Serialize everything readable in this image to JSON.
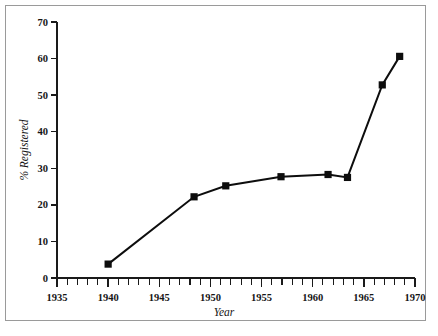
{
  "chart_data": {
    "type": "line",
    "title": "",
    "subtitle": "",
    "xlabel": "Year",
    "ylabel": "% Registered",
    "xlim": [
      1935,
      1970
    ],
    "ylim": [
      0,
      70
    ],
    "grid": false,
    "legend": false,
    "x_tick_labels": [
      "1935",
      "1940",
      "1945",
      "1950",
      "1955",
      "1960",
      "1965",
      "1970"
    ],
    "x_tick_values": [
      1935,
      1940,
      1945,
      1950,
      1955,
      1960,
      1965,
      1970
    ],
    "x_minor_tick_step": 1,
    "y_tick_labels": [
      "0",
      "10",
      "20",
      "30",
      "40",
      "50",
      "60",
      "70"
    ],
    "y_tick_values": [
      0,
      10,
      20,
      30,
      40,
      50,
      60,
      70
    ],
    "series": [
      {
        "name": "% Registered",
        "marker": "square",
        "color": "#0d0d0d",
        "x": [
          1940.0,
          1948.4,
          1951.5,
          1956.9,
          1961.5,
          1963.4,
          1966.8,
          1968.5
        ],
        "y": [
          3.8,
          22.2,
          25.2,
          27.7,
          28.3,
          27.5,
          52.8,
          60.6
        ]
      }
    ]
  },
  "figure": {
    "frame_color": "#9a9a9a",
    "background_color": "#ffffff",
    "axis_color": "#1a1a1a",
    "data_color": "#0d0d0d"
  }
}
